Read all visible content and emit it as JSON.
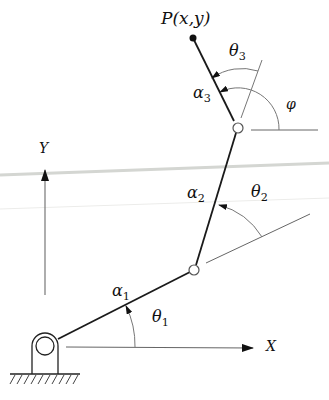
{
  "diagram": {
    "colors": {
      "link": "#1a1a1a",
      "axis": "#555555",
      "ref": "#666666",
      "artifact": "#d4d6d2"
    },
    "labels": {
      "endpoint": "P(x,y)",
      "theta3_base": "θ",
      "theta3_sub": "3",
      "alpha3_base": "α",
      "alpha3_sub": "3",
      "phi": "φ",
      "y_axis": "Y",
      "alpha2_base": "α",
      "alpha2_sub": "2",
      "theta2_base": "θ",
      "theta2_sub": "2",
      "alpha1_base": "α",
      "alpha1_sub": "1",
      "theta1_base": "θ",
      "theta1_sub": "1",
      "x_axis": "X"
    },
    "points": {
      "base": [
        45,
        346
      ],
      "joint2": [
        194,
        270
      ],
      "joint3": [
        238,
        128
      ],
      "endpoint": [
        193,
        38
      ]
    }
  }
}
